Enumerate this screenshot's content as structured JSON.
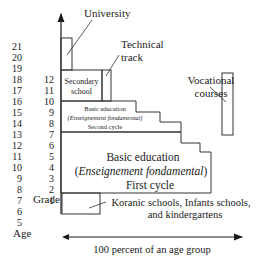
{
  "diagram": {
    "age_axis_label": "Age",
    "grade_axis_label": "Grade",
    "ages": [
      "21",
      "20",
      "19",
      "18",
      "17",
      "16",
      "15",
      "14",
      "13",
      "12",
      "11",
      "10",
      "9",
      "8",
      "7",
      "6",
      "5"
    ],
    "grades": [
      "12",
      "11",
      "10",
      "9",
      "8",
      "7",
      "6",
      "5",
      "4",
      "3",
      "2",
      "1"
    ],
    "boxes": {
      "university": "University",
      "technical_track_line1": "Technical",
      "technical_track_line2": "track",
      "secondary_line1": "Secondary",
      "secondary_line2": "school",
      "second_cycle_line1": "Basic education",
      "second_cycle_line2": "(Enseignement fondamental)",
      "second_cycle_line3": "Second cycle",
      "vocational_line1": "Vocational",
      "vocational_line2": "courses",
      "first_cycle_line1": "Basic education",
      "first_cycle_line2_open": "(",
      "first_cycle_line2_italic": "Enseignement fondamental",
      "first_cycle_line2_close": ")",
      "first_cycle_line3": "First cycle",
      "koranic_line1": "Koranic schools, Infants schools,",
      "koranic_line2": "and kindergartens"
    },
    "x_axis_label": "100 percent of an age group"
  }
}
